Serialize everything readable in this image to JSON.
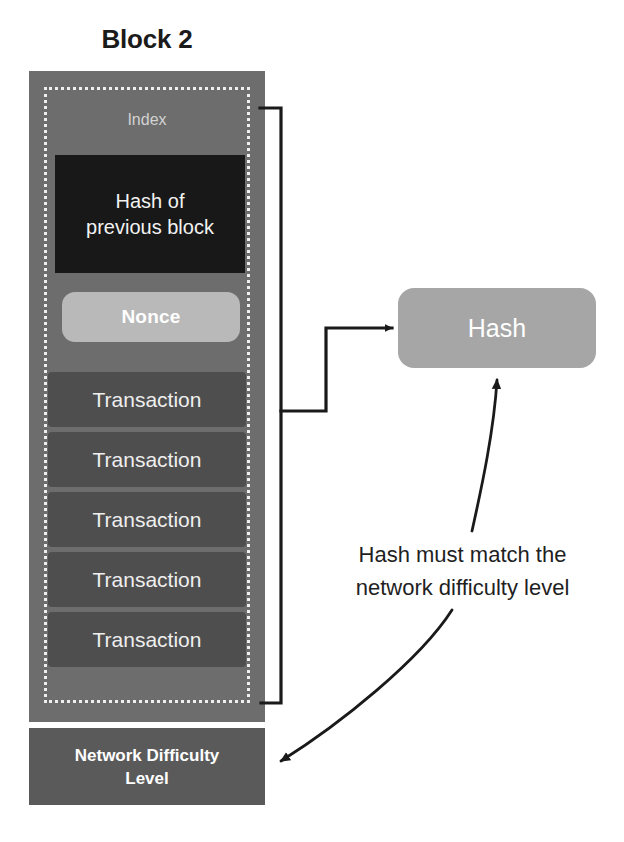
{
  "diagram": {
    "title": "Block 2",
    "block": {
      "index_label": "Index",
      "prev_hash_label": "Hash of\nprevious block",
      "prev_hash_line1": "Hash of",
      "prev_hash_line2": "previous block",
      "nonce_label": "Nonce",
      "transactions": [
        {
          "label": "Transaction"
        },
        {
          "label": "Transaction"
        },
        {
          "label": "Transaction"
        },
        {
          "label": "Transaction"
        },
        {
          "label": "Transaction"
        }
      ],
      "difficulty_line1": "Network Difficulty",
      "difficulty_line2": "Level"
    },
    "hash_node": {
      "label": "Hash"
    },
    "caption": {
      "line1": "Hash must match the",
      "line2": "network difficulty level"
    },
    "colors": {
      "block_body": "#6d6d6d",
      "dotted_border": "#efefef",
      "prev_hash_box": "#181818",
      "nonce_box": "#b9b9b9",
      "transaction_box": "#4e4e4e",
      "difficulty_box": "#5a5a5a",
      "hash_box": "#a6a6a6",
      "connector_line": "#1a1a1a",
      "text_light": "#efefef",
      "text_dark": "#1f1f1f",
      "background": "#ffffff"
    }
  }
}
